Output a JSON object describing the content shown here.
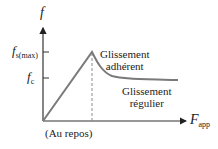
{
  "diagram": {
    "y_axis": {
      "symbol": "f"
    },
    "x_axis": {
      "symbol": "F",
      "subscript": "app"
    },
    "ticks": [
      {
        "symbol": "f",
        "subscript": "s(max)"
      },
      {
        "symbol": "f",
        "subscript": "c"
      }
    ],
    "origin_label": "(Au repos)",
    "regions": [
      {
        "line1": "Glissement",
        "line2": "adhérent"
      },
      {
        "line1": "Glissement",
        "line2": "régulier"
      }
    ],
    "colors": {
      "curve": "#7a7a7a",
      "axes": "#333333",
      "dashed": "#8a8a8a"
    }
  }
}
